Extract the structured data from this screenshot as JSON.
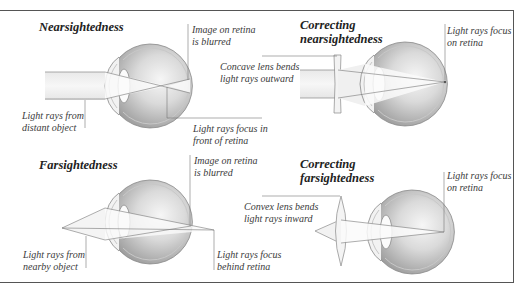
{
  "panels": {
    "nearsightedness": {
      "title": "Nearsightedness",
      "label_image": [
        "Image on retina",
        "is blurred"
      ],
      "label_source": [
        "Light rays from",
        "distant object"
      ],
      "label_focus": [
        "Light rays focus in",
        "front of retina"
      ]
    },
    "correcting_nearsightedness": {
      "title": [
        "Correcting",
        "nearsightedness"
      ],
      "label_lens": [
        "Concave lens bends",
        "light rays outward"
      ],
      "label_focus": [
        "Light rays focus",
        "on retina"
      ]
    },
    "farsightedness": {
      "title": "Farsightedness",
      "label_image": [
        "Image on retina",
        "is blurred"
      ],
      "label_source": [
        "Light rays from",
        "nearby object"
      ],
      "label_focus": [
        "Light rays focus",
        "behind retina"
      ]
    },
    "correcting_farsightedness": {
      "title": [
        "Correcting",
        "farsightedness"
      ],
      "label_lens": [
        "Convex lens bends",
        "light rays inward"
      ],
      "label_focus": [
        "Light rays focus",
        "on retina"
      ]
    }
  },
  "colors": {
    "line": "#6e6e6e",
    "eye_shade_dark": "#a8a8a8",
    "eye_shade_light": "#f4f4f4",
    "beam": "#ececec"
  }
}
